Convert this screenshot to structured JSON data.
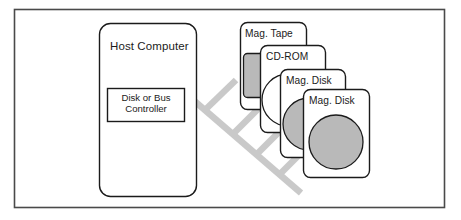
{
  "figure": {
    "name": "host-computer-storage-bus-diagram",
    "frame": {
      "border_color": "#4a4a4a"
    },
    "host": {
      "title": "Host Computer",
      "controller": {
        "line1": "Disk or Bus",
        "line2": "Controller"
      }
    },
    "bus": {
      "name": "disk-bus",
      "color": "#c9c9c9",
      "branch_count": 4
    },
    "devices": [
      {
        "id": "mag-tape",
        "label": "Mag. Tape",
        "media": "cartridge",
        "media_fill": "#b9b9b9"
      },
      {
        "id": "cd-rom",
        "label": "CD-ROM",
        "media": "disc-outline",
        "media_fill": "#ffffff"
      },
      {
        "id": "mag-disk-1",
        "label": "Mag. Disk",
        "media": "platter",
        "media_fill": "#b9b9b9"
      },
      {
        "id": "mag-disk-2",
        "label": "Mag. Disk",
        "media": "platter",
        "media_fill": "#b9b9b9"
      }
    ],
    "colors": {
      "outline": "#1b1b1b",
      "card_fill": "#ffffff",
      "gray_media": "#b9b9b9",
      "bus_gray": "#c9c9c9"
    }
  }
}
